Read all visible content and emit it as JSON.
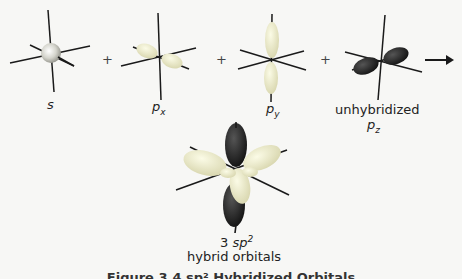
{
  "diagram": {
    "orbitals": [
      {
        "id": "s",
        "label": "s"
      },
      {
        "id": "px",
        "label": "p",
        "subscript": "x"
      },
      {
        "id": "py",
        "label": "p",
        "subscript": "y"
      },
      {
        "id": "pz",
        "label_prefix": "unhybridized",
        "label": "p",
        "subscript": "z"
      }
    ],
    "operators": [
      "+",
      "+",
      "+"
    ],
    "arrow": "→",
    "result": {
      "count": "3",
      "label": "sp",
      "superscript": "2",
      "line2": "hybrid orbitals"
    },
    "caption": "Figure 3.4  sp² Hybridized Orbitals",
    "colors": {
      "light_lobe": "#ecebc7",
      "dark_lobe": "#2a2a2a",
      "axis": "#1a1a1a",
      "s_sphere": "#c8c8c0"
    }
  }
}
